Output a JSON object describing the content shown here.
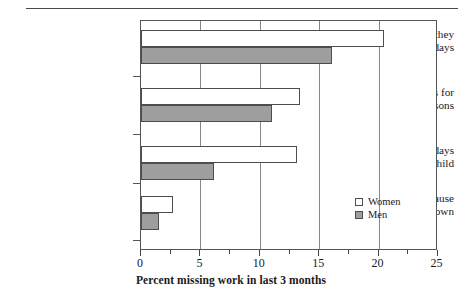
{
  "chart_data": {
    "type": "bar",
    "orientation": "horizontal",
    "title": "",
    "xlabel": "Percent missing work in last 3 months",
    "ylabel": "",
    "xlim": [
      0,
      25
    ],
    "xticks": [
      0,
      5,
      10,
      15,
      20,
      25
    ],
    "xtick_labels": [
      "0",
      "5",
      "10",
      "15",
      "20",
      "25"
    ],
    "minor_xticks": [
      2.5,
      7.5,
      12.5,
      17.5,
      22.5
    ],
    "grid": "vertical gridlines at major ticks",
    "legend_position": "inside right, lower area",
    "categories": [
      "Workers reporting they missed partial days",
      "Missed full days for other family reasons",
      "Missed full days for sick child",
      "Missed full days because of child-care breakdown"
    ],
    "category_lines": [
      [
        "Workers reporting they",
        "missed partial days"
      ],
      [
        "Missed full days for",
        "other family reasons"
      ],
      [
        "Missed full days",
        "for sick child"
      ],
      [
        "Missed full days because",
        "of child-care breakdown"
      ]
    ],
    "series": [
      {
        "name": "Women",
        "color": "#ffffff",
        "values": [
          20.6,
          13.5,
          13.2,
          2.7
        ]
      },
      {
        "name": "Men",
        "color": "#9e9e9e",
        "values": [
          16.2,
          11.1,
          6.2,
          1.5
        ]
      }
    ]
  },
  "legend": {
    "items": [
      {
        "label": "Women",
        "swatch": "white-square-swatch"
      },
      {
        "label": "Men",
        "swatch": "gray-square-swatch"
      }
    ]
  },
  "axis": {
    "x_title": "Percent missing work in last 3 months",
    "tick_labels": [
      "0",
      "5",
      "10",
      "15",
      "20",
      "25"
    ]
  }
}
